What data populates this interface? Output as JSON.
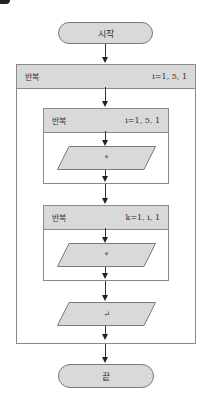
{
  "flowchart": {
    "start": {
      "label": "시작"
    },
    "end": {
      "label": "끝"
    },
    "outer_loop": {
      "keyword": "반복",
      "range": "i=1, 5, 1"
    },
    "inner_loop_1": {
      "keyword": "반복",
      "range": "i=1, 5, 1",
      "output": {
        "label": "*"
      }
    },
    "inner_loop_2": {
      "keyword": "반복",
      "range": "k=1, i, 1",
      "output": {
        "label": "*"
      }
    },
    "newline_output": {
      "label": "↵"
    }
  },
  "colors": {
    "shape_fill": "#d9d9d9",
    "border": "#7a7a7a",
    "line": "#333333"
  }
}
